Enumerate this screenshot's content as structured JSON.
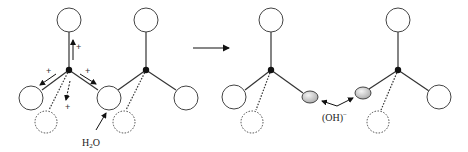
{
  "diagram": {
    "title": "",
    "left_panel": {
      "labels": {
        "water": "H",
        "water_sub": "2",
        "water_o": "O",
        "plus_top": "+",
        "plus_left": "+",
        "plus_right": "+",
        "plus_bottom": "+"
      }
    },
    "reaction_arrow": "reaction-arrow",
    "right_panel": {
      "labels": {
        "hydroxide": "(OH)",
        "hydroxide_charge": "−"
      }
    },
    "colors": {
      "stroke": "#333333",
      "atom_center": "#111111",
      "ion_fill": "#cccccc"
    }
  }
}
